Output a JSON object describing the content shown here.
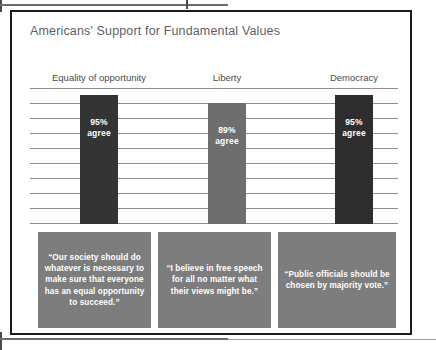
{
  "figure": {
    "title": "Americans' Support for Fundamental Values"
  },
  "chart_data": {
    "type": "bar",
    "title": "Americans' Support for Fundamental Values",
    "xlabel": "",
    "ylabel": "",
    "ylim": [
      0,
      100
    ],
    "grid": true,
    "gridline_count": 10,
    "legend": "none",
    "categories": [
      "Equality of opportunity",
      "Liberty",
      "Democracy"
    ],
    "values": [
      95,
      89,
      95
    ],
    "value_labels": [
      "95%\nagree",
      "89%\nagree",
      "95%\nagree"
    ],
    "bars": [
      {
        "category": "Equality of opportunity",
        "value": 95,
        "value_line1": "95%",
        "value_line2": "agree",
        "color": "#343434"
      },
      {
        "category": "Liberty",
        "value": 89,
        "value_line1": "89%",
        "value_line2": "agree",
        "color": "#6e6e6e"
      },
      {
        "category": "Democracy",
        "value": 95,
        "value_line1": "95%",
        "value_line2": "agree",
        "color": "#2e2e2e"
      }
    ],
    "annotations": [
      {
        "for": "Equality of opportunity",
        "text": "“Our society should do whatever is necessary to make sure that everyone has an equal opportunity to succeed.”",
        "color": "#7d7d7d"
      },
      {
        "for": "Liberty",
        "text": "“I believe in free speech for all no matter what their views might be.”",
        "color": "#7d7d7d"
      },
      {
        "for": "Democracy",
        "text": "“Public officials should be chosen by majority vote.”",
        "color": "#7d7d7d"
      }
    ]
  },
  "colors": {
    "frame": "#1c1c1c",
    "gridline": "#8f8f8f",
    "title_text": "#5f5f5f",
    "category_text": "#4a4a4a",
    "quote_box": "#7d7d7d",
    "quote_text": "#ffffff"
  }
}
